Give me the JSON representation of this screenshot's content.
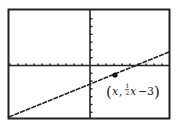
{
  "chart_data": {
    "type": "line",
    "title": "",
    "xlabel": "",
    "ylabel": "",
    "grid": false,
    "legend": null,
    "series": [
      {
        "name": "y = 1/2 x - 3",
        "equation": "y = (1/2)x - 3",
        "slope": 0.5,
        "intercept": -3,
        "x": [
          -10,
          10
        ],
        "y": [
          -8,
          2
        ]
      }
    ],
    "highlighted_point": {
      "x": 3,
      "y": -1.5,
      "label": "(x, ½x − 3)"
    },
    "xlim": [
      -10,
      10
    ],
    "ylim": [
      -7,
      7
    ],
    "x_tick_step": 1,
    "y_tick_step": 1,
    "annotations": [
      "(x, ½x − 3)"
    ]
  },
  "annotation": {
    "open_paren": "(",
    "var_x": "x",
    "comma": ",",
    "frac_num": "1",
    "frac_den": "2",
    "var_x2": "x",
    "minus": "−",
    "const": "3",
    "close_paren": ")"
  },
  "colors": {
    "frame": "#222222",
    "axis": "#222222",
    "line": "#222222",
    "background": "#ffffff"
  }
}
